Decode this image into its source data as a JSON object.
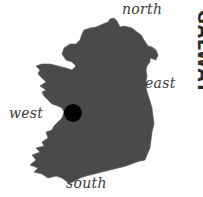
{
  "map": {
    "title": "GALWAY",
    "labels": {
      "north": "north",
      "east": "east",
      "west": "west",
      "south": "south"
    },
    "marker": {
      "x": 73,
      "y": 113,
      "radius": 9,
      "color": "#000000"
    },
    "colors": {
      "land": "#4a4a4a",
      "background": "#ffffff",
      "label": "#3a3a3a"
    }
  }
}
